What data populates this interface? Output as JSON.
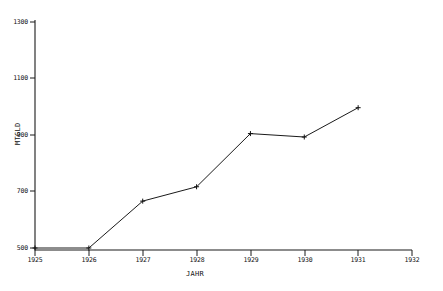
{
  "chart_data": {
    "type": "line",
    "title": "",
    "xlabel": "JAHR",
    "ylabel": "MTGLD",
    "x": [
      1925,
      1926,
      1927,
      1928,
      1929,
      1930,
      1931
    ],
    "values": [
      507,
      507,
      670,
      720,
      905,
      893,
      995
    ],
    "series": [
      {
        "name": "MTGLD",
        "values": [
          507,
          507,
          670,
          720,
          905,
          893,
          995
        ]
      }
    ],
    "xlim": [
      1925,
      1932
    ],
    "ylim": [
      500,
      1300
    ],
    "xticks": [
      1925,
      1926,
      1927,
      1928,
      1929,
      1930,
      1931,
      1932
    ],
    "yticks": [
      500,
      700,
      900,
      1100,
      1300
    ],
    "xtick_labels": [
      "1925",
      "1926",
      "1927",
      "1928",
      "1929",
      "1930",
      "1931",
      "1932"
    ],
    "ytick_labels": [
      "500",
      "700",
      "900",
      "1100",
      "1300"
    ],
    "grid": false,
    "legend": false,
    "marker": "plus",
    "line_color": "#1a1a1a",
    "background": "#ffffff"
  },
  "axes": {
    "y_title": "MTGLD",
    "x_title": "JAHR"
  }
}
